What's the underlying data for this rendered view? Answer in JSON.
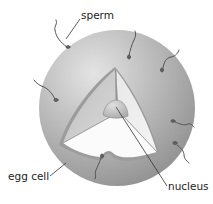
{
  "diagram": {
    "labels": {
      "sperm": "sperm",
      "egg_cell": "egg cell",
      "nucleus": "nucleus"
    },
    "colors": {
      "background": "#ffffff",
      "sphere_light": "#d8d8d8",
      "sphere_dark": "#8f8f8f",
      "inner_face_light": "#e6e6e6",
      "inner_face_mid": "#c4c4c4",
      "nucleus": "#bdbdbd",
      "sperm": "#555555",
      "leader_line": "#333333",
      "text": "#222222"
    },
    "sperm_count": 7
  }
}
